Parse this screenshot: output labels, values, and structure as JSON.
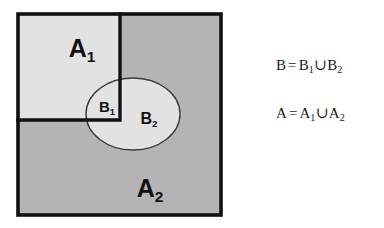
{
  "figure": {
    "colors": {
      "outer_region_fill": "#b4b4b4",
      "inner_region_fill": "#e2e2e2",
      "ellipse_fill": "#e2e2e2",
      "border_stroke": "#111111",
      "ellipse_stroke": "#3a3a3a",
      "background": "#ffffff",
      "text": "#111111"
    },
    "geometry": {
      "outer_rect": {
        "x": 18,
        "y": 14,
        "width": 203,
        "height": 201
      },
      "inner_rect": {
        "x": 18,
        "y": 14,
        "width": 102,
        "height": 106
      },
      "ellipse": {
        "cx": 133,
        "cy": 114,
        "rx": 47,
        "ry": 36
      }
    }
  },
  "labels": {
    "a1": {
      "base": "A",
      "sub": "1"
    },
    "a2": {
      "base": "A",
      "sub": "2"
    },
    "b1": {
      "base": "B",
      "sub": "1"
    },
    "b2": {
      "base": "B",
      "sub": "2"
    }
  },
  "equations": {
    "b": {
      "lhs": "B",
      "equals": "=",
      "term1_base": "B",
      "term1_sub": "1",
      "union": "∪",
      "term2_base": "B",
      "term2_sub": "2"
    },
    "a": {
      "lhs": "A",
      "equals": "=",
      "term1_base": "A",
      "term1_sub": "1",
      "union": "∪",
      "term2_base": "A",
      "term2_sub": "2"
    }
  }
}
